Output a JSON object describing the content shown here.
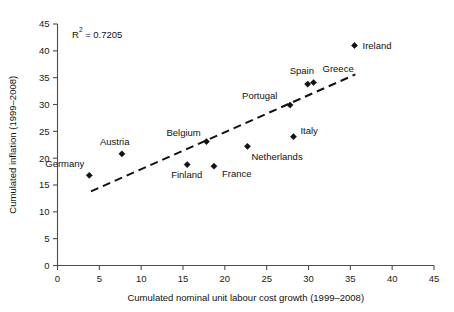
{
  "chart_data": {
    "type": "scatter",
    "title": "",
    "xlabel": "Cumulated nominal unit labour cost growth (1999–2008)",
    "ylabel": "Cumulated inflation (1999–2008)",
    "xlim": [
      0,
      45
    ],
    "ylim": [
      0,
      45
    ],
    "xticks": [
      "0",
      "5",
      "10",
      "15",
      "20",
      "25",
      "30",
      "35",
      "40",
      "45"
    ],
    "yticks": [
      "0",
      "5",
      "10",
      "15",
      "20",
      "25",
      "30",
      "35",
      "40",
      "45"
    ],
    "grid": false,
    "legend": "none",
    "annotations": {
      "r2_prefix": "R",
      "r2_exponent": "2",
      "r2_value": " = 0.7205",
      "r2_full": "R² = 0.7205"
    },
    "points": [
      {
        "label": "Germany",
        "x": 3.8,
        "y": 16.8,
        "label_dx": -44,
        "label_dy": -8
      },
      {
        "label": "Austria",
        "x": 7.7,
        "y": 20.8,
        "label_dx": -22,
        "label_dy": -9
      },
      {
        "label": "Finland",
        "x": 15.5,
        "y": 18.8,
        "label_dx": -16,
        "label_dy": 13
      },
      {
        "label": "Belgium",
        "x": 17.8,
        "y": 23.1,
        "label_dx": -40,
        "label_dy": -6
      },
      {
        "label": "France",
        "x": 18.7,
        "y": 18.5,
        "label_dx": 8,
        "label_dy": 11
      },
      {
        "label": "Netherlands",
        "x": 22.7,
        "y": 22.2,
        "label_dx": 4,
        "label_dy": 14
      },
      {
        "label": "Portugal",
        "x": 27.8,
        "y": 29.9,
        "label_dx": -48,
        "label_dy": -6
      },
      {
        "label": "Italy",
        "x": 28.2,
        "y": 24.0,
        "label_dx": 7,
        "label_dy": -3
      },
      {
        "label": "Spain",
        "x": 29.9,
        "y": 33.8,
        "label_dx": -18,
        "label_dy": -10
      },
      {
        "label": "Greece",
        "x": 30.6,
        "y": 34.1,
        "label_dx": 9,
        "label_dy": -10
      },
      {
        "label": "Ireland",
        "x": 35.5,
        "y": 41.0,
        "label_dx": 8,
        "label_dy": 4
      }
    ],
    "trend_line": {
      "style": "dashed",
      "x_start": 4.0,
      "y_start": 13.8,
      "x_end": 35.6,
      "y_end": 35.6
    }
  }
}
